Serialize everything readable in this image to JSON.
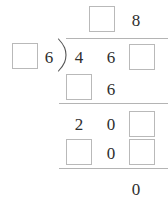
{
  "worksheet": {
    "type": "long-division",
    "quotient": {
      "digits": [
        {
          "value": "",
          "blank": true
        },
        {
          "value": "8",
          "blank": false
        }
      ]
    },
    "divisor": {
      "digits": [
        {
          "value": "",
          "blank": true
        },
        {
          "value": "6",
          "blank": false
        }
      ]
    },
    "dividend": {
      "digits": [
        {
          "value": "4",
          "blank": false
        },
        {
          "value": "6",
          "blank": false
        },
        {
          "value": "",
          "blank": true
        }
      ]
    },
    "steps": [
      {
        "name": "first-product",
        "digits": [
          {
            "value": "",
            "blank": true
          },
          {
            "value": "6",
            "blank": false
          }
        ]
      },
      {
        "name": "first-difference",
        "digits": [
          {
            "value": "2",
            "blank": false
          },
          {
            "value": "0",
            "blank": false
          },
          {
            "value": "",
            "blank": true
          }
        ]
      },
      {
        "name": "second-product",
        "digits": [
          {
            "value": "",
            "blank": true
          },
          {
            "value": "0",
            "blank": false
          },
          {
            "value": "",
            "blank": true
          }
        ]
      }
    ],
    "remainder": {
      "digits": [
        {
          "value": "0",
          "blank": false
        }
      ]
    }
  },
  "colors": {
    "ink": "#2e2e2e",
    "rule": "#b4b4b4",
    "box_border": "#b9b9b9",
    "background": "#ffffff"
  }
}
